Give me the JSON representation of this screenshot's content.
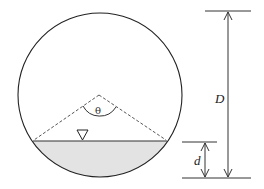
{
  "diagram": {
    "title": "",
    "labels": {
      "theta": "θ",
      "diameter": "D",
      "depth": "d"
    },
    "colors": {
      "line": "#222222",
      "water_fill": "#e3e3e3",
      "dashed": "#444444"
    },
    "elements": [
      "circular pipe cross-section",
      "water surface chord with free-surface symbol (inverted triangle)",
      "dashed radii from center to chord endpoints",
      "central angle arc labeled θ",
      "dimension arrow D (pipe diameter)",
      "dimension arrow d (flow depth)"
    ]
  }
}
